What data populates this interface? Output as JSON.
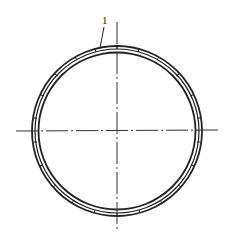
{
  "diagram": {
    "type": "technical-drawing",
    "annotations": [
      {
        "id": "1",
        "text": "1",
        "target": "ring"
      }
    ],
    "center": [
      117,
      131
    ],
    "outer_radius": 85,
    "ring_lines": 3,
    "center_lines": [
      "horizontal",
      "vertical"
    ]
  }
}
